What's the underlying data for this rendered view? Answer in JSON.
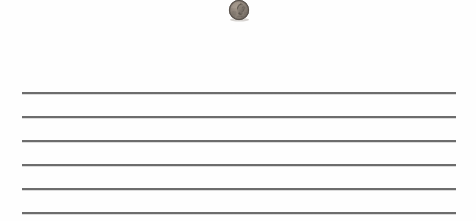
{
  "scene": {
    "title": "Penny on ruled paper",
    "width": 476,
    "height": 221,
    "background_color": "#fefefe"
  },
  "coin": {
    "name": "penny",
    "denomination": "One Cent",
    "country": "United States",
    "design": "Lincoln cent obverse",
    "subject": "Abraham Lincoln profile facing right",
    "condition": "worn",
    "material_tone": "oxidized copper / gray-brown",
    "base_color": "#8a8078",
    "rim_color": "#6d655d",
    "shadow_color": "#4a443e",
    "highlight_color": "#b3a89c",
    "diameter_px": 32,
    "center_x": 239,
    "center_y": 17,
    "clipped_at_top": true
  },
  "ruled_lines": {
    "count": 6,
    "color": "#3f3f3f",
    "thickness_px": 2,
    "left_x": 22,
    "right_x": 456,
    "length_px": 434,
    "spacing_px": 24,
    "y_positions": [
      92,
      116,
      140,
      164,
      188,
      212
    ],
    "labels": [
      "line-1",
      "line-2",
      "line-3",
      "line-4",
      "line-5",
      "line-6"
    ]
  }
}
